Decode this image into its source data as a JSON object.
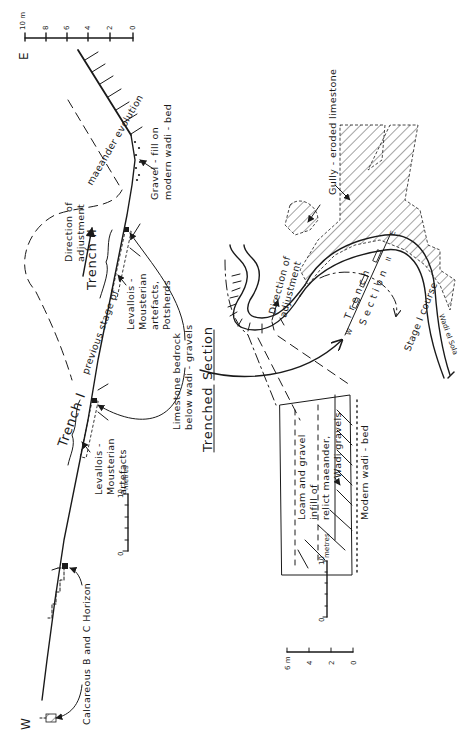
{
  "figure": {
    "orientation": "rotated 90 degrees counter-clockwise",
    "profile": {
      "west_label": "W",
      "east_label": "E",
      "vertical_scale": {
        "unit": "10 m",
        "ticks": [
          "0",
          "2",
          "4",
          "6",
          "8",
          "10 m"
        ]
      },
      "horizontal_scale": {
        "ticks": [
          "0",
          "10"
        ],
        "unit": "metres"
      },
      "labels": {
        "calcareous": "Calcareous  B  and  C  Horizon",
        "trench_1": "Trench I",
        "trench_2": "Trench II",
        "levallois_1_line1": "Levallois -",
        "levallois_1_line2": "Mousterian",
        "levallois_1_line3": "artefacts",
        "levallois_2_line1": "Levallois -",
        "levallois_2_line2": "Mousterian",
        "levallois_2_line3": "artefacts,",
        "levallois_2_line4": "Potsherds",
        "limestone_line1": "Limestone  bedrock",
        "limestone_line2": "below  wadi - gravels",
        "previous_stage": "previous   stage   of",
        "meander_evolution": "maeander   evolution",
        "direction_line1": "Direction  of",
        "direction_line2": "adjustment",
        "gravel_fill_line1": "Gravel - fill  on",
        "gravel_fill_line2": "modern  wadi - bed"
      }
    },
    "plan": {
      "title_word1": "Trenched",
      "title_word2": "Section",
      "labels": {
        "gully": "Gully - eroded  limestone",
        "direction_line1": "Direction  of",
        "direction_line2": "adjustment",
        "trench_section_a": "T r e n c h",
        "trench_section_b": "S e c t i o n",
        "trench_w": "W",
        "trench_e": "E",
        "trench_1": "I",
        "trench_2": "II",
        "wadi": "Wadi  el  Sola",
        "stage_course": "Stage  I  course",
        "loam_line1": "Loam   and   gravel",
        "loam_line2": "infill   of",
        "loam_line3": "relict  maeander,",
        "wadi_gravels": "Wadi  gravels",
        "modern_bed": "Modern  wadi - bed"
      },
      "horizontal_scale": {
        "ticks": [
          "0",
          "10"
        ],
        "unit": "metres"
      },
      "vertical_scale": {
        "ticks": [
          "0",
          "2",
          "4",
          "6 m"
        ]
      }
    }
  },
  "colors": {
    "ink": "#1a1a1a",
    "paper": "#ffffff"
  }
}
